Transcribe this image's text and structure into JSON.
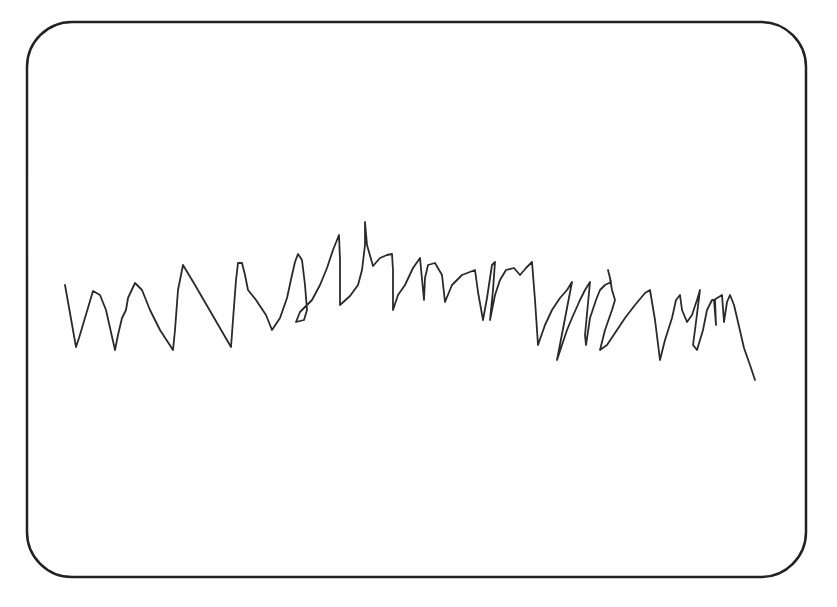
{
  "frame": {
    "x": 27,
    "y": 22,
    "width": 779,
    "height": 555,
    "corner_radius": 45,
    "stroke_color": "#222222",
    "stroke_width": 2.5
  },
  "drawing": {
    "description": "hand-drawn continuous zigzag scribble line",
    "stroke_color": "#2a2a2a",
    "stroke_width": 1.8,
    "points": "65,285 76,347 79,338 93,291 100,295 106,310 115,350 118,335 122,318 126,310 128,298 135,283 142,290 150,310 160,330 173,350 175,330 178,290 183,265 195,285 231,347 233,320 236,280 238,263 242,263 245,275 248,290 256,300 266,315 272,330 280,318 287,298 292,275 295,262 298,254 302,260 305,285 307,310 304,320 296,322 300,312 312,300 320,285 327,268 333,250 339,235 340,260 340,305 350,296 358,285 362,270 365,245 365,222 367,245 373,266 380,258 387,255 392,254 393,270 393,310 398,295 405,285 413,268 420,258 424,300 425,278 428,265 435,263 442,275 445,302 452,285 462,275 475,270 478,292 483,320 487,298 490,278 492,265 495,262 493,290 490,320 495,295 500,280 506,270 514,268 520,275 526,268 532,262 535,300 538,345 545,325 552,310 560,298 567,290 572,282 557,360 562,345 567,330 572,318 580,300 585,290 590,282 585,335 586,345 590,318 596,300 600,290 605,285 611,282 608,270 610,278 612,290 615,300 612,310 605,330 600,350 607,345 615,333 625,318 635,305 645,293 650,290 655,320 660,360 665,340 672,318 676,300 680,295 682,310 687,322 692,315 697,300 700,290 695,330 693,345 697,350 703,330 707,310 712,300 715,300 716,325 714,300 722,295 724,322 727,302 730,295 734,305 738,322 744,348 750,365 755,380"
  }
}
